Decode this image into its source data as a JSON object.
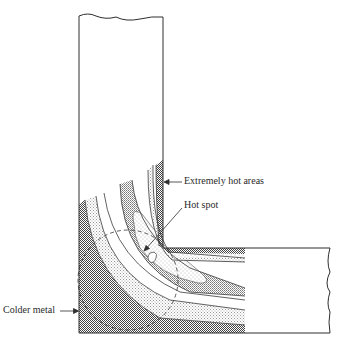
{
  "figure": {
    "type": "diagram",
    "labels": {
      "extremely_hot": "Extremely hot areas",
      "hot_spot": "Hot spot",
      "colder_metal": "Colder metal"
    },
    "colors": {
      "outline": "#3a3a3a",
      "dense_shading": "#6e6e6e",
      "medium_shading": "#a6a6a6",
      "light_shading": "#d2d2d2",
      "stipple": "#e2e2e2",
      "background": "#ffffff"
    }
  }
}
